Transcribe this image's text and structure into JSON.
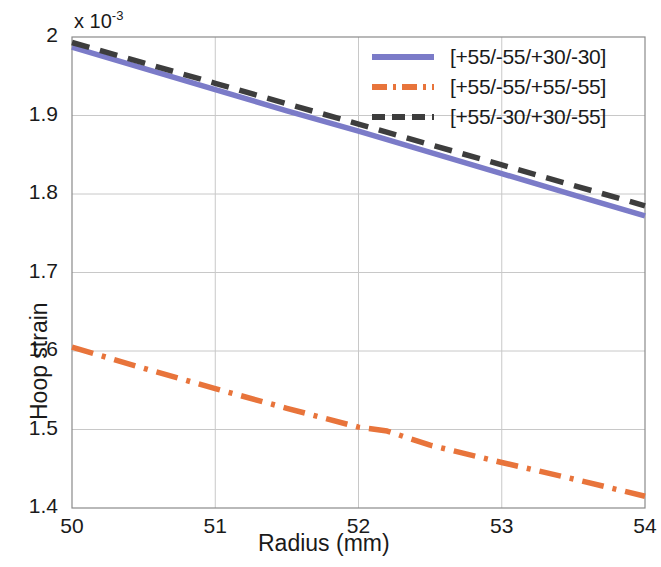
{
  "chart_data": {
    "type": "line",
    "title": "",
    "xlabel": "Radius (mm)",
    "ylabel": "Hoop strain",
    "y_exponent_label": "x 10",
    "y_exponent_power": "-3",
    "xlim": [
      50,
      54
    ],
    "ylim": [
      1.4,
      2.0
    ],
    "xticks": [
      "50",
      "51",
      "52",
      "53",
      "54"
    ],
    "yticks": [
      "1.4",
      "1.5",
      "1.6",
      "1.7",
      "1.8",
      "1.9",
      "2"
    ],
    "grid": true,
    "legend_position": "top-right",
    "series": [
      {
        "name": "[+55/-55/+30/-30]",
        "color": "#7b7bc8",
        "style": "solid",
        "x": [
          50,
          50.5,
          51,
          51.5,
          52,
          52.5,
          53,
          53.5,
          54
        ],
        "values": [
          1.987,
          1.96,
          1.933,
          1.906,
          1.88,
          1.853,
          1.826,
          1.799,
          1.772
        ]
      },
      {
        "name": "[+55/-55/+55/-55]",
        "color": "#e8743b",
        "style": "dash-dot",
        "x": [
          50,
          50.5,
          51,
          51.5,
          52,
          52.2,
          52.5,
          53,
          53.5,
          54
        ],
        "values": [
          1.605,
          1.578,
          1.552,
          1.527,
          1.503,
          1.498,
          1.48,
          1.458,
          1.437,
          1.415
        ]
      },
      {
        "name": "[+55/-30/+30/-55]",
        "color": "#3d3d3d",
        "style": "dashed",
        "x": [
          50,
          50.5,
          51,
          51.5,
          52,
          52.5,
          53,
          53.5,
          54
        ],
        "values": [
          1.993,
          1.967,
          1.941,
          1.915,
          1.889,
          1.863,
          1.837,
          1.811,
          1.785
        ]
      }
    ]
  },
  "axes": {
    "plot_left": 72,
    "plot_top": 37,
    "plot_right": 645,
    "plot_bottom": 508,
    "grid_color": "#c8c8c8",
    "frame_color": "#8a8a8a"
  }
}
